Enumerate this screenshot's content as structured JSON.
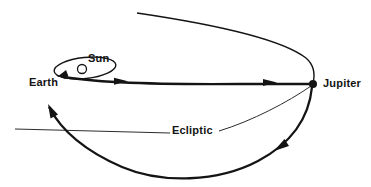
{
  "diagram": {
    "labels": {
      "sun": "Sun",
      "earth": "Earth",
      "jupiter": "Jupiter",
      "ecliptic": "Ecliptic"
    }
  },
  "colors": {
    "line": "#141414",
    "background": "#ffffff"
  }
}
